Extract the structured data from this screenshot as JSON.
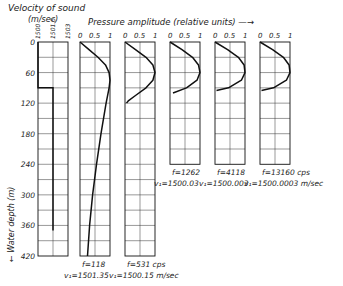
{
  "chart_data": {
    "type": "line",
    "title": "",
    "velocity_panel": {
      "title_line1": "Velocity of sound",
      "title_line2": "(m/sec)",
      "x_ticks": [
        "1500",
        "1501.5",
        "1503"
      ],
      "profile": [
        {
          "depth": 0,
          "v": 1500
        },
        {
          "depth": 90,
          "v": 1500
        },
        {
          "depth": 90,
          "v": 1501.5
        },
        {
          "depth": 370,
          "v": 1501.5
        }
      ]
    },
    "pressure_header": "Pressure amplitude (relative units) —→",
    "pressure_ticks": [
      "0",
      "0.5",
      "1"
    ],
    "ylabel": "← Water depth (m)",
    "y_ticks": [
      "0",
      "60",
      "120",
      "180",
      "240",
      "300",
      "360",
      "420"
    ],
    "ylim": [
      0,
      420
    ],
    "series": [
      {
        "name": "f=118",
        "f_label": "f=118",
        "v_label": "v₁=1501.35",
        "panel_depth": 420,
        "points": [
          [
            0,
            0
          ],
          [
            15,
            0.3
          ],
          [
            30,
            0.6
          ],
          [
            45,
            0.85
          ],
          [
            60,
            0.97
          ],
          [
            75,
            1.0
          ],
          [
            90,
            0.97
          ],
          [
            120,
            0.87
          ],
          [
            180,
            0.7
          ],
          [
            240,
            0.55
          ],
          [
            300,
            0.42
          ],
          [
            360,
            0.32
          ],
          [
            420,
            0.25
          ]
        ]
      },
      {
        "name": "f=531",
        "f_label": "f=531 cps",
        "v_label": "v₁=1500.15 m/sec",
        "panel_depth": 420,
        "points": [
          [
            0,
            0
          ],
          [
            15,
            0.35
          ],
          [
            30,
            0.7
          ],
          [
            45,
            0.93
          ],
          [
            60,
            1.0
          ],
          [
            75,
            0.93
          ],
          [
            90,
            0.7
          ],
          [
            105,
            0.35
          ],
          [
            115,
            0.12
          ],
          [
            120,
            0.05
          ]
        ]
      },
      {
        "name": "f=1262",
        "f_label": "f=1262",
        "v_label": "v₁=1500.03",
        "panel_depth": 240,
        "points": [
          [
            0,
            0
          ],
          [
            15,
            0.4
          ],
          [
            30,
            0.75
          ],
          [
            45,
            0.95
          ],
          [
            60,
            1.0
          ],
          [
            75,
            0.9
          ],
          [
            90,
            0.55
          ],
          [
            100,
            0.1
          ]
        ]
      },
      {
        "name": "f=4118",
        "f_label": "f=4118",
        "v_label": "v₁=1500.003",
        "panel_depth": 240,
        "points": [
          [
            0,
            0
          ],
          [
            15,
            0.42
          ],
          [
            30,
            0.78
          ],
          [
            45,
            0.97
          ],
          [
            60,
            1.0
          ],
          [
            75,
            0.88
          ],
          [
            90,
            0.45
          ],
          [
            95,
            0.05
          ]
        ]
      },
      {
        "name": "f=13160",
        "f_label": "f=13160 cps",
        "v_label": "v₁=1500.0003 m/sec",
        "panel_depth": 240,
        "points": [
          [
            0,
            0
          ],
          [
            15,
            0.42
          ],
          [
            30,
            0.78
          ],
          [
            45,
            0.97
          ],
          [
            60,
            1.0
          ],
          [
            75,
            0.88
          ],
          [
            90,
            0.45
          ],
          [
            95,
            0.05
          ]
        ]
      }
    ]
  }
}
